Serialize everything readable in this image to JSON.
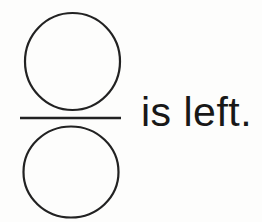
{
  "caption": {
    "text": "is left."
  },
  "figure": {
    "shapes": [
      "top-circle",
      "fraction-bar",
      "bottom-circle"
    ],
    "meaning": "fraction of two stacked circles separated by a horizontal bar"
  },
  "colors": {
    "ink": "#222222",
    "background": "#fdfdfc"
  }
}
